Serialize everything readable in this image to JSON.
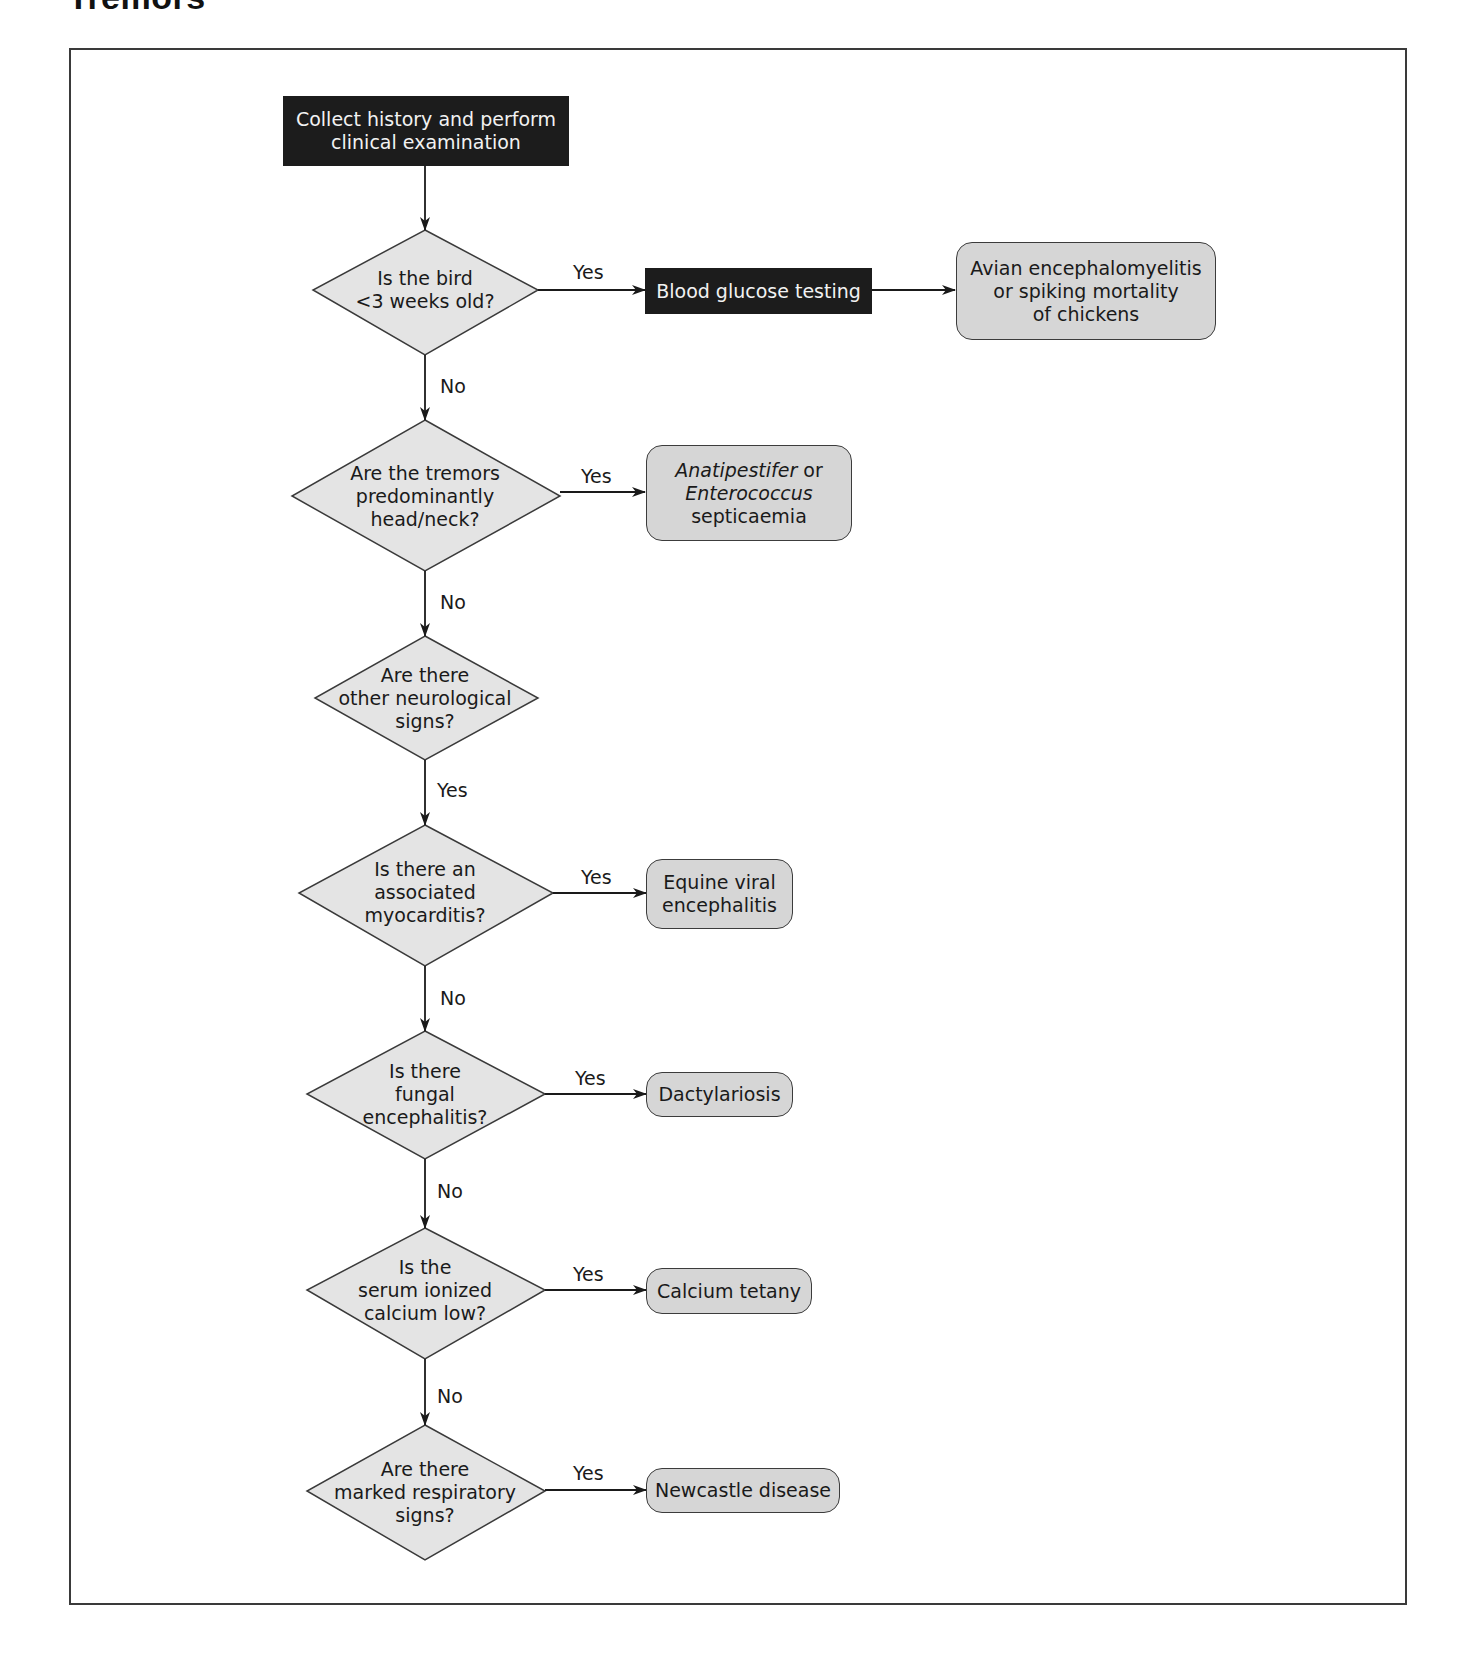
{
  "figure": {
    "title": "Tremors"
  },
  "nodes": {
    "start": {
      "text": "Collect history and perform\nclinical examination"
    },
    "blood_glucose": {
      "text": "Blood glucose testing"
    },
    "q1": {
      "text": "Is the bird\n<3 weeks old?"
    },
    "q2": {
      "text": "Are the tremors\npredominantly\nhead/neck?"
    },
    "q3": {
      "text": "Are there\nother neurological\nsigns?"
    },
    "q4": {
      "text": "Is there an\nassociated\nmyocarditis?"
    },
    "q5": {
      "text": "Is there\nfungal\nencephalitis?"
    },
    "q6": {
      "text": "Is the\nserum ionized\ncalcium low?"
    },
    "q7": {
      "text": "Are there\nmarked respiratory\nsigns?"
    },
    "r1": {
      "text": "Avian encephalomyelitis\nor spiking mortality\nof chickens"
    },
    "r2": {
      "line1_italic": "Anatipestifer",
      "line1_rest": " or",
      "line2_italic": "Enterococcus",
      "line3": "septicaemia"
    },
    "r4": {
      "text": "Equine viral\nencephalitis"
    },
    "r5": {
      "text": "Dactylariosis"
    },
    "r6": {
      "text": "Calcium tetany"
    },
    "r7": {
      "text": "Newcastle disease"
    }
  },
  "edge_labels": {
    "q1_yes": "Yes",
    "q1_no": "No",
    "q2_yes": "Yes",
    "q2_no": "No",
    "q3_yes": "Yes",
    "q4_yes": "Yes",
    "q4_no": "No",
    "q5_yes": "Yes",
    "q5_no": "No",
    "q6_yes": "Yes",
    "q6_no": "No",
    "q7_yes": "Yes"
  },
  "colors": {
    "dark_box": "#1c1c1c",
    "decision_fill": "#e4e4e4",
    "result_fill": "#d6d6d6",
    "line": "#1a1a1a"
  }
}
